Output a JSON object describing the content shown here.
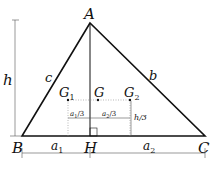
{
  "diagram": {
    "type": "triangle-centroid",
    "vertices": {
      "A": {
        "label": "A",
        "x": 90,
        "y": 23
      },
      "B": {
        "label": "B",
        "x": 22,
        "y": 136
      },
      "C": {
        "label": "C",
        "x": 205,
        "y": 136
      },
      "H": {
        "label": "H",
        "x": 90,
        "y": 136
      }
    },
    "sides": {
      "c": "c",
      "b": "b"
    },
    "centroids": {
      "G1": {
        "label": "G",
        "sub": "1"
      },
      "G": {
        "label": "G"
      },
      "G2": {
        "label": "G",
        "sub": "2"
      }
    },
    "dimensions": {
      "h": "h",
      "h3": "h/3",
      "a1": {
        "label": "a",
        "sub": "1"
      },
      "a2": {
        "label": "a",
        "sub": "2"
      },
      "a1_3": {
        "label": "a",
        "sub": "1",
        "suffix": "/3"
      },
      "a2_3": {
        "label": "a",
        "sub": "2",
        "suffix": "/3"
      }
    },
    "colors": {
      "stroke": "#111111",
      "dim": "#555555",
      "dotted": "#888888"
    }
  }
}
